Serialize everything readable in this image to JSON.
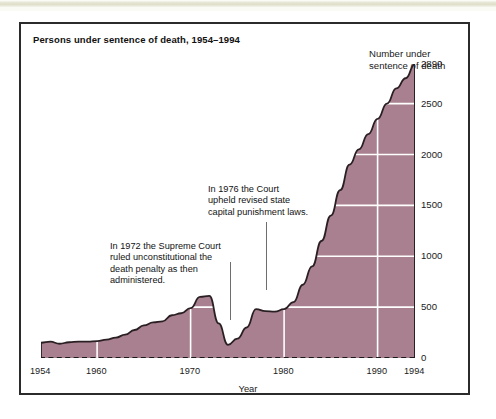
{
  "page": {
    "ghost_text": "­         ­            ­        ­          ­",
    "background_color": "#ffffff",
    "frame_border_color": "#2b2b2b"
  },
  "chart_data": {
    "type": "area",
    "title": "Persons under sentence of death, 1954–1994",
    "xlabel": "Year",
    "ylabel": "Number under\nsentence of death",
    "ylabel_line1": "Number under",
    "ylabel_line2": "sentence of death",
    "xlim": [
      1954,
      1994
    ],
    "ylim": [
      0,
      2890
    ],
    "grid": true,
    "grid_color": "#ffffff",
    "legend": null,
    "fill_color": "#a8808f",
    "line_color": "#2a2024",
    "baseline_style": "dashed",
    "baseline_color": "#1b1b1b",
    "ytick_labels": [
      "0",
      "500",
      "1000",
      "1500",
      "2000",
      "2500",
      "2890"
    ],
    "ytick_values": [
      0,
      500,
      1000,
      1500,
      2000,
      2500,
      2890
    ],
    "xtick_labels": [
      "1954",
      "1960",
      "1970",
      "1980",
      "1990",
      "1994"
    ],
    "xtick_values": [
      1954,
      1960,
      1970,
      1980,
      1990,
      1994
    ],
    "x": [
      1954,
      1955,
      1956,
      1957,
      1958,
      1959,
      1960,
      1961,
      1962,
      1963,
      1964,
      1965,
      1966,
      1967,
      1968,
      1969,
      1970,
      1971,
      1972,
      1973,
      1974,
      1975,
      1976,
      1977,
      1978,
      1979,
      1980,
      1981,
      1982,
      1983,
      1984,
      1985,
      1986,
      1987,
      1988,
      1989,
      1990,
      1991,
      1992,
      1993,
      1994
    ],
    "values": [
      150,
      160,
      140,
      155,
      160,
      160,
      165,
      180,
      200,
      230,
      275,
      320,
      350,
      360,
      420,
      440,
      490,
      600,
      610,
      340,
      130,
      190,
      300,
      480,
      460,
      455,
      480,
      550,
      720,
      900,
      1150,
      1400,
      1650,
      1900,
      2050,
      2200,
      2350,
      2500,
      2650,
      2750,
      2890
    ],
    "annotations": [
      {
        "id": "annotation-1972",
        "text": "In 1972 the Supreme Court\nruled unconstitutional the\ndeath penalty as then\nadministered.",
        "year": 1972
      },
      {
        "id": "annotation-1976",
        "text": "In 1976 the Court\nupheld revised state\ncapital punishment laws.",
        "year": 1976
      }
    ]
  }
}
